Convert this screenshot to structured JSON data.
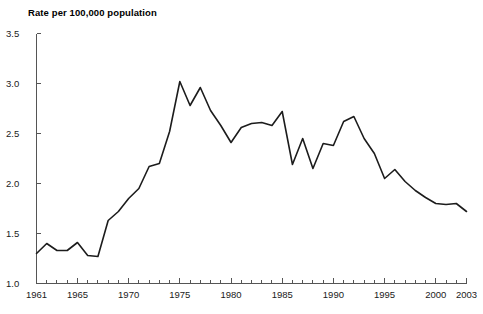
{
  "chart_data": {
    "type": "line",
    "title": "Rate per 100,000 population",
    "xlabel": "",
    "ylabel": "Rate per 100,000 population",
    "xlim": [
      1961,
      2003
    ],
    "ylim": [
      1.0,
      3.5
    ],
    "grid": false,
    "legend": null,
    "y_ticks": [
      "1.0",
      "1.5",
      "2.0",
      "2.5",
      "3.0",
      "3.5"
    ],
    "y_tick_values": [
      1.0,
      1.5,
      2.0,
      2.5,
      3.0,
      3.5
    ],
    "x_ticks": [
      "1961",
      "1965",
      "1970",
      "1975",
      "1980",
      "1985",
      "1990",
      "1995",
      "2000",
      "2003"
    ],
    "x_tick_values": [
      1961,
      1965,
      1970,
      1975,
      1980,
      1985,
      1990,
      1995,
      2000,
      2003
    ],
    "x_minor_tick_step": 1,
    "line_color": "#1c1c1c",
    "axis_color": "#555555",
    "series": [
      {
        "name": "Rate per 100,000 population",
        "x": [
          1961,
          1962,
          1963,
          1964,
          1965,
          1966,
          1967,
          1968,
          1969,
          1970,
          1971,
          1972,
          1973,
          1974,
          1975,
          1976,
          1977,
          1978,
          1979,
          1980,
          1981,
          1982,
          1983,
          1984,
          1985,
          1986,
          1987,
          1988,
          1989,
          1990,
          1991,
          1992,
          1993,
          1994,
          1995,
          1996,
          1997,
          1998,
          1999,
          2000,
          2001,
          2002,
          2003
        ],
        "values": [
          1.3,
          1.4,
          1.33,
          1.33,
          1.41,
          1.28,
          1.27,
          1.63,
          1.72,
          1.85,
          1.95,
          2.17,
          2.2,
          2.52,
          3.02,
          2.78,
          2.96,
          2.73,
          2.58,
          2.41,
          2.56,
          2.6,
          2.61,
          2.58,
          2.72,
          2.19,
          2.45,
          2.15,
          2.4,
          2.38,
          2.62,
          2.67,
          2.45,
          2.3,
          2.05,
          2.14,
          2.02,
          1.93,
          1.86,
          1.8,
          1.79,
          1.8,
          1.72
        ]
      }
    ]
  }
}
